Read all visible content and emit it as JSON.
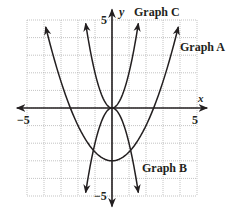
{
  "chart_data": {
    "type": "line",
    "title": "",
    "xlabel": "x",
    "ylabel": "y",
    "xlim": [
      -5,
      5
    ],
    "ylim": [
      -5,
      5
    ],
    "grid": true,
    "tick_labels": {
      "x_min": "−5",
      "x_max": "5",
      "y_min": "−5",
      "y_max": "5"
    },
    "series": [
      {
        "name": "Graph A",
        "equation": "y = 0.5x^2 - 3",
        "vertex": [
          0,
          -3
        ],
        "x_range": [
          -3.9,
          3.9
        ]
      },
      {
        "name": "Graph B",
        "equation": "y = -2x^2",
        "vertex": [
          0,
          0
        ],
        "x_range": [
          -1.55,
          1.55
        ]
      },
      {
        "name": "Graph C",
        "equation": "y = 2x^2",
        "vertex": [
          0,
          0
        ],
        "x_range": [
          -1.55,
          1.55
        ]
      }
    ]
  },
  "labels": {
    "graph_a": "Graph A",
    "graph_b": "Graph B",
    "graph_c": "Graph C",
    "x_axis": "x",
    "y_axis": "y",
    "x_min": "−5",
    "x_max": "5",
    "y_min": "−5",
    "y_max": "5"
  },
  "colors": {
    "ink": "#231f20",
    "grid": "#9a9a9a"
  }
}
